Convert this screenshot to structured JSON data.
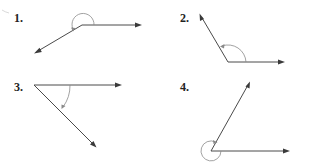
{
  "figure": {
    "colors": {
      "background": "#ffffff",
      "ray": "#4a4a4a",
      "arc": "#8a8a8a",
      "label": "#222222"
    },
    "panels": [
      {
        "label": "1.",
        "angle_type": "reflex",
        "description": "Horizontal ray to the right and a ray to the lower left; arc drawn over the top (reflex angle) with counter-clockwise arrow"
      },
      {
        "label": "2.",
        "angle_type": "obtuse",
        "description": "Horizontal ray to the right and a ray to the upper left; arc drawn counter-clockwise from right ray to upper-left ray"
      },
      {
        "label": "3.",
        "angle_type": "acute",
        "description": "Horizontal ray to the right and a ray to the lower right; arc drawn clockwise from right ray to lower ray"
      },
      {
        "label": "4.",
        "angle_type": "reflex",
        "description": "Horizontal ray to the right and a ray to the upper right; nearly full-circle arc around the vertex (reflex angle)"
      }
    ]
  }
}
